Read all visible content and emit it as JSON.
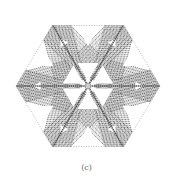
{
  "figure": {
    "caption": "(c)",
    "center": [
      88,
      86
    ],
    "radius": 72,
    "colors": {
      "line": "#555555",
      "atom": "#444444",
      "light": "#aaaaaa",
      "background": "#ffffff"
    },
    "axes_through_center": 3,
    "triangular_voids": 12
  }
}
